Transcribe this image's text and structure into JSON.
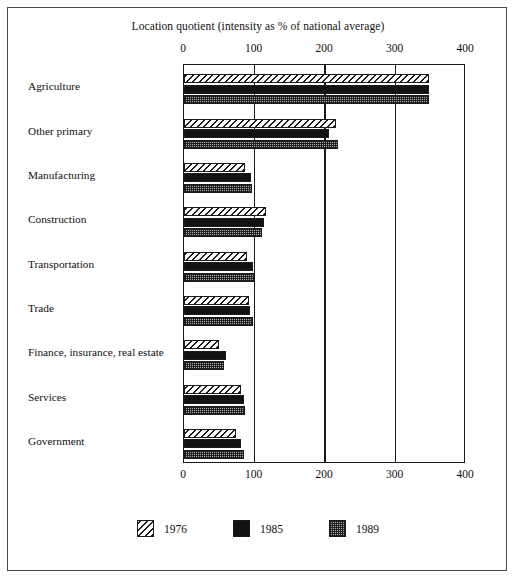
{
  "chart_data": {
    "type": "bar",
    "orientation": "horizontal",
    "title": "Location quotient (intensity as % of national average)",
    "xlabel": "",
    "ylabel": "",
    "xlim": [
      0,
      400
    ],
    "xticks": [
      0,
      100,
      200,
      300,
      400
    ],
    "xtick_labels": [
      "0",
      "100",
      "200",
      "300",
      "400"
    ],
    "grid": "vertical gridlines at each tick",
    "axis_labels_position": "top and bottom",
    "legend_position": "bottom-center",
    "categories": [
      "Agriculture",
      "Other primary",
      "Manufacturing",
      "Construction",
      "Transportation",
      "Trade",
      "Finance, insurance, real estate",
      "Services",
      "Government"
    ],
    "series": [
      {
        "name": "1976",
        "fill": "diagonal-hatch",
        "values": [
          348,
          216,
          87,
          116,
          89,
          92,
          50,
          81,
          74
        ]
      },
      {
        "name": "1985",
        "fill": "solid-black",
        "values": [
          347,
          206,
          95,
          113,
          98,
          94,
          60,
          85,
          81
        ]
      },
      {
        "name": "1989",
        "fill": "gray-checker",
        "values": [
          347,
          218,
          96,
          111,
          99,
          98,
          57,
          87,
          85
        ]
      }
    ]
  },
  "colors": {
    "frame": "#4a4a4a",
    "axis": "#1a1a1a",
    "series_1976": "#ffffff",
    "series_1985": "#121212",
    "series_1989": "#a8a8a8",
    "background": "#ffffff",
    "text": "#111111"
  }
}
